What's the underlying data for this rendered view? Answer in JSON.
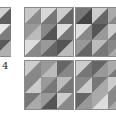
{
  "figure": {
    "panel_label": "4",
    "grids": [
      {
        "id": "partial-left",
        "cells": [
          [
            "#bdbdbd",
            "#7a7a7a"
          ],
          [
            "#cfcfcf",
            "#6e6e6e"
          ],
          [
            "#d0d0d0",
            "#5e5e5e"
          ],
          [
            "#9a9a9a",
            "#bdbdbd"
          ],
          [
            "#8a8a8a",
            "#5a5a5a"
          ],
          [
            "#e6e6e6",
            "#7c7c7c"
          ],
          [
            "#d4d4d4",
            "#8a8a8a"
          ],
          [
            "#9a9a9a",
            "#6a6a6a"
          ],
          [
            "#5a5a5a",
            "#b0b0b0"
          ]
        ]
      },
      {
        "id": "top-left",
        "cells": [
          [
            "#c8c8c8",
            "#8a8a8a"
          ],
          [
            "#d8d8d8",
            "#777777"
          ],
          [
            "#cccccc",
            "#666666"
          ],
          [
            "#999999",
            "#bbbbbb"
          ],
          [
            "#888888",
            "#555555"
          ],
          [
            "#dddddd",
            "#777777"
          ],
          [
            "#dddddd",
            "#888888"
          ],
          [
            "#999999",
            "#666666"
          ],
          [
            "#555555",
            "#bbbbbb"
          ]
        ]
      },
      {
        "id": "top-right",
        "cells": [
          [
            "#777777",
            "#444444"
          ],
          [
            "#cccccc",
            "#666666"
          ],
          [
            "#aaaaaa",
            "#888888"
          ],
          [
            "#dddddd",
            "#888888"
          ],
          [
            "#555555",
            "#999999"
          ],
          [
            "#cccccc",
            "#777777"
          ],
          [
            "#999999",
            "#666666"
          ],
          [
            "#bbbbbb",
            "#777777"
          ],
          [
            "#888888",
            "#aaaaaa"
          ]
        ]
      },
      {
        "id": "bottom-left",
        "cells": [
          [
            "#cccccc",
            "#888888"
          ],
          [
            "#999999",
            "#bbbbbb"
          ],
          [
            "#666666",
            "#888888"
          ],
          [
            "#888888",
            "#cccccc"
          ],
          [
            "#999999",
            "#777777"
          ],
          [
            "#bbbbbb",
            "#777777"
          ],
          [
            "#777777",
            "#aaaaaa"
          ],
          [
            "#999999",
            "#555555"
          ],
          [
            "#cccccc",
            "#888888"
          ]
        ]
      },
      {
        "id": "bottom-right",
        "cells": [
          [
            "#cccccc",
            "#777777"
          ],
          [
            "#666666",
            "#999999"
          ],
          [
            "#aaaaaa",
            "#777777"
          ],
          [
            "#888888",
            "#cccccc"
          ],
          [
            "#777777",
            "#aaaaaa"
          ],
          [
            "#cccccc",
            "#888888"
          ],
          [
            "#666666",
            "#999999"
          ],
          [
            "#aaaaaa",
            "#dddddd"
          ],
          [
            "#888888",
            "#aaaaaa"
          ]
        ]
      }
    ]
  }
}
